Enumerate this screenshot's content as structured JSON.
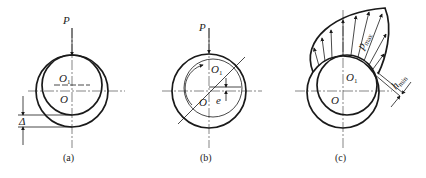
{
  "figure": {
    "panels": [
      {
        "id": "a",
        "caption": "(a)",
        "labels": {
          "load": "P",
          "journal_center": "O",
          "journal_center_sub": "1",
          "bearing_center": "O",
          "clearance": "Δ"
        }
      },
      {
        "id": "b",
        "caption": "(b)",
        "labels": {
          "load": "P",
          "journal_center": "O",
          "journal_center_sub": "1",
          "bearing_center": "O",
          "eccentricity": "e"
        }
      },
      {
        "id": "c",
        "caption": "(c)",
        "labels": {
          "journal_center": "O",
          "journal_center_sub": "1",
          "bearing_center": "O",
          "pressure": "p",
          "pressure_sub": "max",
          "film": "h",
          "film_sub": "min"
        }
      }
    ]
  }
}
